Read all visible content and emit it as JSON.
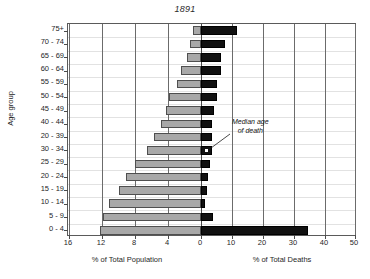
{
  "chart_data": {
    "type": "bar",
    "title": "1891",
    "subtitle": "",
    "orientation": "horizontal",
    "layout": "population-pyramid",
    "ylabel": "Age group",
    "grid": true,
    "legend_position": "none",
    "categories": [
      "75+",
      "70 - 74",
      "65 - 69",
      "60 - 64",
      "55 - 59",
      "50 - 54",
      "45 - 49",
      "40 - 44",
      "20 - 39",
      "30 - 34",
      "25 - 29",
      "20 - 24",
      "15 - 19",
      "10 - 14",
      "5 - 9",
      "0 - 4"
    ],
    "left_panel": {
      "xlabel": "% of Total Population",
      "tick_labels": [
        "16",
        "12",
        "8",
        "4",
        "0"
      ],
      "tick_values": [
        16,
        12,
        8,
        4,
        0
      ],
      "xlim": [
        16,
        0
      ],
      "series_name": "% of Total Population",
      "color": "#a8a8a8",
      "values": [
        1.0,
        1.3,
        1.7,
        2.4,
        2.9,
        3.9,
        4.2,
        4.9,
        5.7,
        6.6,
        8.0,
        9.1,
        10.0,
        11.1,
        11.9,
        12.2
      ]
    },
    "right_panel": {
      "xlabel": "% of Total Deaths",
      "tick_labels": [
        "0",
        "10",
        "20",
        "30",
        "40",
        "50"
      ],
      "tick_values": [
        0,
        10,
        20,
        30,
        40,
        50
      ],
      "xlim": [
        0,
        50
      ],
      "series_name": "% of Total Deaths",
      "color": "#111111",
      "values": [
        11.7,
        7.6,
        6.4,
        6.5,
        5.1,
        5.0,
        4.2,
        3.7,
        3.6,
        3.4,
        2.8,
        2.4,
        2.0,
        1.4,
        4.0,
        34.6
      ]
    },
    "annotation": {
      "line1": "Median age",
      "line2": "of death",
      "points_to_category": "30 - 34"
    }
  }
}
